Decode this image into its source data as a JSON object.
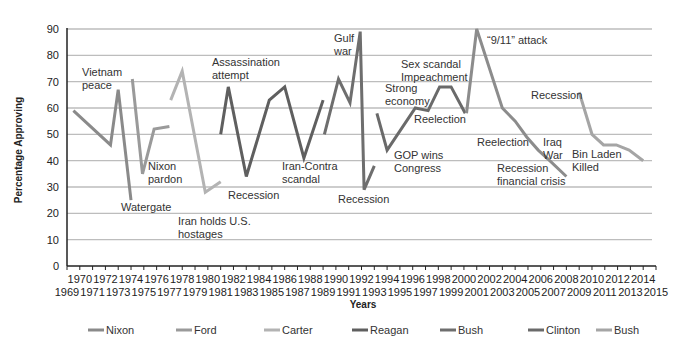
{
  "chart_data": {
    "type": "line",
    "title": "",
    "xlabel": "Years",
    "ylabel": "Percentage Approving",
    "xlim": [
      1969,
      2015
    ],
    "ylim": [
      0,
      90
    ],
    "yticks": [
      0,
      10,
      20,
      30,
      40,
      50,
      60,
      70,
      80,
      90
    ],
    "xticks_top_row": [
      "1970",
      "1972",
      "1974",
      "1976",
      "1978",
      "1980",
      "1982",
      "1984",
      "1986",
      "1988",
      "1990",
      "1992",
      "1994",
      "1996",
      "1998",
      "2000",
      "2002",
      "2004",
      "2006",
      "2008",
      "2010",
      "2012",
      "2014"
    ],
    "xticks_bottom_row": [
      "1969",
      "1971",
      "1973",
      "1975",
      "1977",
      "1979",
      "1981",
      "1983",
      "1985",
      "1987",
      "1989",
      "1991",
      "1993",
      "1995",
      "1997",
      "1999",
      "2001",
      "2003",
      "2005",
      "2007",
      "2009",
      "2011",
      "2013",
      "2015"
    ],
    "grid": true,
    "legend_position": "bottom",
    "series": [
      {
        "name": "Nixon",
        "color": "#8a8a8a",
        "points": [
          [
            1969.5,
            59
          ],
          [
            1972.4,
            46
          ],
          [
            1973.0,
            67
          ],
          [
            1974.0,
            25
          ]
        ]
      },
      {
        "name": "Ford",
        "color": "#9a9a9a",
        "points": [
          [
            1974.1,
            71
          ],
          [
            1974.9,
            35
          ],
          [
            1975.8,
            52
          ],
          [
            1977.0,
            53
          ]
        ]
      },
      {
        "name": "Carter",
        "color": "#b3b3b3",
        "points": [
          [
            1977.1,
            63
          ],
          [
            1978.0,
            74
          ],
          [
            1979.8,
            28
          ],
          [
            1981.0,
            32
          ]
        ]
      },
      {
        "name": "Reagan",
        "color": "#5f5f5f",
        "points": [
          [
            1981.0,
            50
          ],
          [
            1981.6,
            68
          ],
          [
            1983.0,
            34
          ],
          [
            1984.8,
            63
          ],
          [
            1986.0,
            68
          ],
          [
            1987.5,
            41
          ],
          [
            1989.0,
            63
          ]
        ]
      },
      {
        "name": "Bush",
        "color": "#6e6e6e",
        "points": [
          [
            1989.1,
            50
          ],
          [
            1990.2,
            71
          ],
          [
            1991.1,
            62
          ],
          [
            1991.9,
            89
          ],
          [
            1992.2,
            29
          ],
          [
            1993.0,
            38
          ]
        ]
      },
      {
        "name": "Clinton",
        "color": "#6a6a6a",
        "points": [
          [
            1993.2,
            58
          ],
          [
            1994.0,
            44
          ],
          [
            1996.2,
            60
          ],
          [
            1997.2,
            59
          ],
          [
            1998.1,
            68
          ],
          [
            1999.0,
            68
          ],
          [
            2000.1,
            58
          ]
        ]
      },
      {
        "name": "Bush",
        "color": "#8c8c8c",
        "points": [
          [
            2000.2,
            58
          ],
          [
            2001.0,
            90
          ],
          [
            2003.0,
            60
          ],
          [
            2004.0,
            55
          ],
          [
            2004.9,
            49
          ],
          [
            2005.8,
            44
          ],
          [
            2006.7,
            40
          ],
          [
            2008.0,
            34
          ]
        ]
      },
      {
        "name": "Bush",
        "color": "#a5a5a5",
        "points": [
          [
            2009.0,
            66
          ],
          [
            2010.0,
            50
          ],
          [
            2010.9,
            46
          ],
          [
            2011.9,
            46
          ],
          [
            2012.9,
            44
          ],
          [
            2014.0,
            40
          ]
        ]
      }
    ],
    "annotations": [
      {
        "lines": [
          "Vietnam",
          "peace"
        ],
        "x": 82,
        "y": 76
      },
      {
        "lines": [
          "Watergate"
        ],
        "x": 121,
        "y": 211
      },
      {
        "lines": [
          "Nixon",
          "pardon"
        ],
        "x": 148,
        "y": 170
      },
      {
        "lines": [
          "Iran holds U.S.",
          "hostages"
        ],
        "x": 178,
        "y": 225
      },
      {
        "lines": [
          "Assassination",
          "attempt"
        ],
        "x": 212,
        "y": 66
      },
      {
        "lines": [
          "Recession"
        ],
        "x": 228,
        "y": 199
      },
      {
        "lines": [
          "Iran-Contra",
          "scandal"
        ],
        "x": 282,
        "y": 170
      },
      {
        "lines": [
          "Gulf",
          "war"
        ],
        "x": 334,
        "y": 42
      },
      {
        "lines": [
          "Recession"
        ],
        "x": 338,
        "y": 203
      },
      {
        "lines": [
          "Strong",
          "economy"
        ],
        "x": 385,
        "y": 92
      },
      {
        "lines": [
          "GOP wins",
          "Congress"
        ],
        "x": 394,
        "y": 159
      },
      {
        "lines": [
          "Sex scandal",
          "Impeachment"
        ],
        "x": 401,
        "y": 68
      },
      {
        "lines": [
          "Reelection"
        ],
        "x": 414,
        "y": 123
      },
      {
        "lines": [
          "“9/11” attack"
        ],
        "x": 487,
        "y": 44
      },
      {
        "lines": [
          "Reelection"
        ],
        "x": 477,
        "y": 146
      },
      {
        "lines": [
          "Recession",
          "financial crisis"
        ],
        "x": 497,
        "y": 172
      },
      {
        "lines": [
          "Iraq",
          "War"
        ],
        "x": 543,
        "y": 146
      },
      {
        "lines": [
          "Recession"
        ],
        "x": 531,
        "y": 99
      },
      {
        "lines": [
          "Bin Laden",
          "Killed"
        ],
        "x": 572,
        "y": 158
      }
    ]
  },
  "legend": [
    {
      "label": "Nixon",
      "color": "#8a8a8a"
    },
    {
      "label": "Ford",
      "color": "#9a9a9a"
    },
    {
      "label": "Carter",
      "color": "#b3b3b3"
    },
    {
      "label": "Reagan",
      "color": "#5f5f5f"
    },
    {
      "label": "Bush",
      "color": "#6e6e6e"
    },
    {
      "label": "Clinton",
      "color": "#6a6a6a"
    },
    {
      "label": "Bush",
      "color": "#a5a5a5"
    }
  ],
  "axes": {
    "y_title": "Percentage Approving",
    "x_title": "Years"
  },
  "style": {
    "grid_color": "#bdbdbd",
    "axis_color": "#222222"
  }
}
